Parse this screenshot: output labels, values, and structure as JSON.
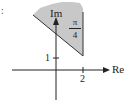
{
  "figure": {
    "type": "complex-plane-region",
    "marker": ":",
    "axes": {
      "real_label": "Re",
      "imag_label": "Im",
      "real_tick": "2",
      "imag_tick": "1"
    },
    "region": {
      "fill_color": "#c8c8c8",
      "angle_label_numerator": "π",
      "angle_label_denominator": "4"
    },
    "colors": {
      "axis": "#222222",
      "region_fill": "#c8c8c8",
      "background": "#ffffff"
    }
  }
}
